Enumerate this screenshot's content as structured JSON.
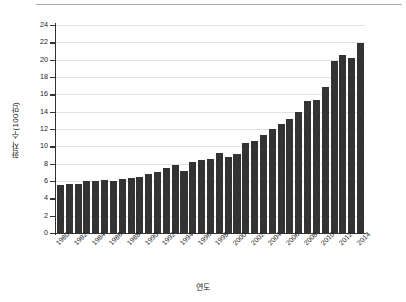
{
  "chart_data": {
    "type": "bar",
    "title": "",
    "xlabel": "연도",
    "ylabel": "환자 수(100만)",
    "ylim": [
      0,
      24
    ],
    "ytick_step": 2,
    "yticks": [
      24,
      22,
      20,
      18,
      16,
      14,
      12,
      10,
      8,
      6,
      4,
      2,
      0
    ],
    "grid": true,
    "legend": null,
    "bar_color": "#333333",
    "gridline_color": "#e2e2e2",
    "axis_color": "#333333",
    "background_color": "#ffffff",
    "xtick_labels": [
      "1980",
      "1982",
      "1984",
      "1986",
      "1988",
      "1990",
      "1992",
      "1994",
      "1996",
      "1998",
      "2000",
      "2002",
      "2004",
      "2006",
      "2008",
      "2010",
      "2012",
      "2014"
    ],
    "categories": [
      "1980",
      "1981",
      "1982",
      "1983",
      "1984",
      "1985",
      "1986",
      "1987",
      "1988",
      "1989",
      "1990",
      "1991",
      "1992",
      "1993",
      "1994",
      "1995",
      "1996",
      "1997",
      "1998",
      "1999",
      "2000",
      "2001",
      "2002",
      "2003",
      "2004",
      "2005",
      "2006",
      "2007",
      "2008",
      "2009",
      "2010",
      "2011",
      "2012",
      "2013",
      "2014"
    ],
    "values": [
      5.5,
      5.7,
      5.7,
      6.0,
      6.0,
      6.1,
      6.0,
      6.2,
      6.4,
      6.5,
      6.8,
      7.0,
      7.5,
      7.8,
      7.1,
      8.2,
      8.4,
      8.5,
      9.2,
      8.8,
      9.1,
      10.4,
      10.6,
      11.3,
      12.0,
      12.6,
      13.1,
      14.0,
      15.2,
      15.3,
      16.9,
      19.9,
      20.5,
      20.2,
      21.9
    ]
  }
}
